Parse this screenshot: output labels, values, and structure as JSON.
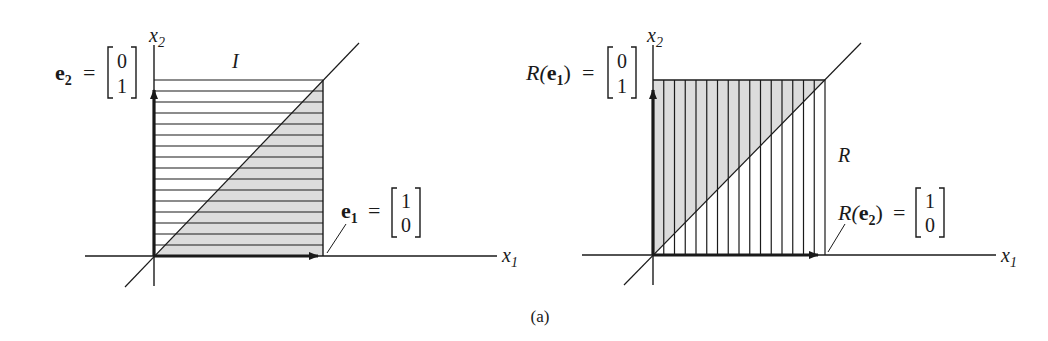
{
  "figure": {
    "caption": "(a)",
    "background": "#ffffff",
    "ink_color": "#1a1a1a",
    "shade_color": "#dcdcdc"
  },
  "left_panel": {
    "region_label": "I",
    "x_axis_label": "x",
    "x_axis_sub": "1",
    "y_axis_label": "x",
    "y_axis_sub": "2",
    "hatch": "horizontal",
    "hatch_lines": 16,
    "shaded_triangle": "below-diagonal",
    "vector_e2": {
      "name": "e",
      "sub": "2",
      "eq": "=",
      "top": "0",
      "bottom": "1"
    },
    "vector_e1": {
      "name": "e",
      "sub": "1",
      "eq": "=",
      "top": "1",
      "bottom": "0"
    }
  },
  "right_panel": {
    "region_label": "R",
    "x_axis_label": "x",
    "x_axis_sub": "1",
    "y_axis_label": "x",
    "y_axis_sub": "2",
    "hatch": "vertical",
    "hatch_lines": 16,
    "shaded_triangle": "above-diagonal",
    "vector_re1": {
      "fn": "R(",
      "name": "e",
      "sub": "1",
      "close": ")",
      "eq": "=",
      "top": "0",
      "bottom": "1"
    },
    "vector_re2": {
      "fn": "R(",
      "name": "e",
      "sub": "2",
      "close": ")",
      "eq": "=",
      "top": "1",
      "bottom": "0"
    }
  }
}
